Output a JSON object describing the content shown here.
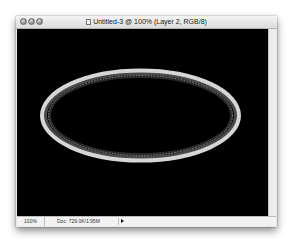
{
  "window": {
    "title": "Untitled-3 @ 100% (Layer 2, RGB/8)",
    "buttons": [
      "close",
      "minimize",
      "zoom"
    ]
  },
  "canvas": {
    "background": "#000000",
    "shape": {
      "type": "ellipse",
      "outer_stroke_color": "#d6d6d6",
      "inner_ring_color": "#4a4a4a",
      "selection": "marching-ants"
    }
  },
  "statusbar": {
    "zoom_level": "100%",
    "doc_info": "Doc: 729.0K/1.95M"
  }
}
